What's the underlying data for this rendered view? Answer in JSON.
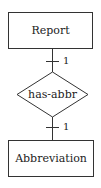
{
  "diagram": {
    "type": "entity-relationship",
    "entities": [
      {
        "id": "report",
        "label": "Report"
      },
      {
        "id": "abbreviation",
        "label": "Abbreviation"
      }
    ],
    "relationship": {
      "label": "has-abbr"
    },
    "connectors": [
      {
        "from": "report",
        "to": "has-abbr",
        "cardinality": "1"
      },
      {
        "from": "has-abbr",
        "to": "abbreviation",
        "cardinality": "1"
      }
    ]
  }
}
